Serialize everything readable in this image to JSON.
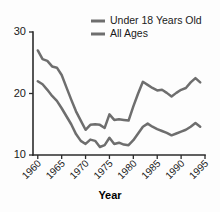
{
  "chart_data": {
    "type": "line",
    "title": "",
    "subtitle": "",
    "xlabel": "Year",
    "ylabel": "",
    "xlim": [
      1959,
      1995
    ],
    "ylim": [
      10,
      30
    ],
    "grid": false,
    "legend_position": "top-right",
    "xticks": [
      1960,
      1965,
      1970,
      1975,
      1980,
      1985,
      1990,
      1995
    ],
    "xtick_labels": [
      "1960",
      "1965",
      "1970",
      "1975",
      "1980",
      "1985",
      "1990",
      "1995"
    ],
    "yticks": [
      10,
      20,
      30
    ],
    "ytick_labels": [
      "10",
      "20",
      "30"
    ],
    "x": [
      1960,
      1961,
      1962,
      1963,
      1964,
      1965,
      1966,
      1967,
      1968,
      1969,
      1970,
      1971,
      1972,
      1973,
      1974,
      1975,
      1976,
      1977,
      1978,
      1979,
      1980,
      1981,
      1982,
      1983,
      1984,
      1985,
      1986,
      1987,
      1988,
      1989,
      1990,
      1991,
      1992,
      1993,
      1994
    ],
    "series": [
      {
        "name": "Under 18 Years Old",
        "color": "#6e6e6e",
        "values": [
          27.0,
          25.6,
          25.3,
          24.4,
          24.2,
          23.0,
          21.0,
          19.0,
          17.1,
          15.6,
          14.1,
          14.9,
          15.0,
          14.9,
          14.4,
          16.6,
          15.7,
          15.8,
          15.7,
          15.6,
          17.9,
          20.0,
          21.9,
          21.4,
          20.9,
          20.5,
          20.6,
          20.1,
          19.5,
          20.1,
          20.6,
          20.9,
          21.8,
          22.5,
          21.8
        ]
      },
      {
        "name": "All Ages",
        "color": "#6e6e6e",
        "values": [
          22.0,
          21.5,
          20.6,
          19.6,
          18.8,
          17.6,
          16.3,
          15.0,
          13.4,
          12.3,
          11.8,
          12.5,
          12.3,
          11.3,
          11.6,
          12.8,
          11.8,
          12.0,
          11.7,
          11.6,
          12.4,
          13.5,
          14.6,
          15.1,
          14.6,
          14.2,
          13.9,
          13.6,
          13.2,
          13.5,
          13.8,
          14.1,
          14.6,
          15.2,
          14.6
        ]
      }
    ]
  },
  "legend": {
    "items": [
      {
        "label": "Under 18 Years Old",
        "color": "#6e6e6e"
      },
      {
        "label": "All Ages",
        "color": "#6e6e6e"
      }
    ]
  },
  "axes": {
    "x_title": "Year"
  }
}
